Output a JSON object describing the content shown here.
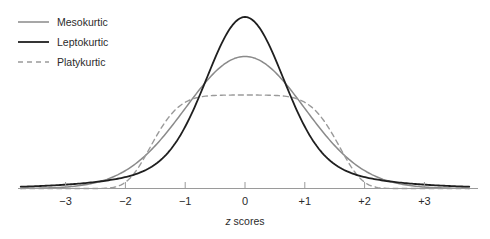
{
  "chart_data": {
    "type": "line",
    "title": "",
    "subtitle": "",
    "xlabel_italic": "z",
    "xlabel_rest": " scores",
    "xlabel": "z scores",
    "ylabel": "",
    "grid": false,
    "legend_position": "top-left",
    "xlim": [
      -3.6,
      3.6
    ],
    "ylim": [
      0,
      1.0
    ],
    "xticks": [
      -3,
      -2,
      -1,
      0,
      1,
      2,
      3
    ],
    "xticklabels": [
      "−3",
      "−2",
      "−1",
      "0",
      "+1",
      "+2",
      "+3"
    ],
    "x": [
      -3.6,
      -3.4,
      -3.2,
      -3.0,
      -2.8,
      -2.6,
      -2.4,
      -2.2,
      -2.0,
      -1.8,
      -1.6,
      -1.4,
      -1.2,
      -1.0,
      -0.8,
      -0.6,
      -0.4,
      -0.2,
      0.0,
      0.2,
      0.4,
      0.6,
      0.8,
      1.0,
      1.2,
      1.4,
      1.6,
      1.8,
      2.0,
      2.2,
      2.4,
      2.6,
      2.8,
      3.0,
      3.2,
      3.4,
      3.6
    ],
    "series": [
      {
        "name": "Mesokurtic",
        "kind": "normal",
        "sigma": 1.0,
        "peak": 0.77,
        "color": "#8a8a8a",
        "dash": "none",
        "width": 1.5,
        "values": [
          0.0013,
          0.0028,
          0.0058,
          0.0114,
          0.0214,
          0.0384,
          0.0659,
          0.1082,
          0.17,
          0.2561,
          0.37,
          0.5125,
          0.6801,
          0.8646,
          1.0534,
          1.2295,
          1.3744,
          1.4711,
          1.5051,
          1.4711,
          1.3744,
          1.2295,
          1.0534,
          0.8646,
          0.6801,
          0.5125,
          0.37,
          0.2561,
          0.17,
          0.1082,
          0.0659,
          0.0384,
          0.0214,
          0.0114,
          0.0058,
          0.0028,
          0.0013
        ]
      },
      {
        "name": "Leptokurtic",
        "kind": "peaked",
        "sigma": 0.62,
        "peak": 1.0,
        "color": "#1f1f1f",
        "dash": "none",
        "width": 1.8,
        "values": [
          0.009,
          0.0142,
          0.0221,
          0.0339,
          0.0513,
          0.0766,
          0.1128,
          0.1635,
          0.233,
          0.3261,
          0.4473,
          0.5994,
          0.7804,
          0.9805,
          1.1773,
          1.3404,
          1.444,
          1.4808,
          1.49,
          1.4808,
          1.444,
          1.3404,
          1.1773,
          0.9805,
          0.7804,
          0.5994,
          0.4473,
          0.3261,
          0.233,
          0.1635,
          0.1128,
          0.0766,
          0.0513,
          0.0339,
          0.0221,
          0.0142,
          0.009
        ]
      },
      {
        "name": "Platykurtic",
        "kind": "flat",
        "sigma": 1.45,
        "peak": 0.545,
        "color": "#9a9a9a",
        "dash": "5,4",
        "width": 1.4,
        "values": [
          0.0041,
          0.0096,
          0.0212,
          0.0444,
          0.0878,
          0.1638,
          0.288,
          0.4771,
          0.744,
          1.0906,
          1.4968,
          1.9,
          2.18,
          2.36,
          2.44,
          2.48,
          2.495,
          2.5,
          2.5,
          2.5,
          2.495,
          2.48,
          2.44,
          2.36,
          2.18,
          1.9,
          1.4968,
          1.0906,
          0.744,
          0.4771,
          0.288,
          0.1638,
          0.0878,
          0.0444,
          0.0212,
          0.0096,
          0.0041
        ]
      }
    ],
    "legend": [
      {
        "label": "Mesokurtic",
        "color": "#8a8a8a",
        "dash": "none"
      },
      {
        "label": "Leptokurtic",
        "color": "#1f1f1f",
        "dash": "none"
      },
      {
        "label": "Platykurtic",
        "color": "#9a9a9a",
        "dash": "5,4"
      }
    ],
    "axis_color": "#9a9a9a",
    "tick_color": "#9a9a9a"
  },
  "legend": {
    "items": [
      {
        "label": "Mesokurtic"
      },
      {
        "label": "Leptokurtic"
      },
      {
        "label": "Platykurtic"
      }
    ]
  },
  "axis": {
    "labels": [
      "−3",
      "−2",
      "−1",
      "0",
      "+1",
      "+2",
      "+3"
    ],
    "title_italic": "z",
    "title_rest": " scores"
  }
}
